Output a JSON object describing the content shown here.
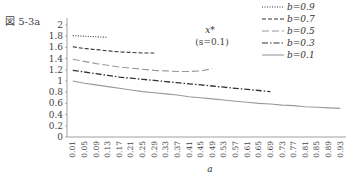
{
  "figure_label": "図 5-3a",
  "annotation": {
    "line1": "x*",
    "line2": "(s=0.1)"
  },
  "chart_data": {
    "type": "line",
    "title": "図 5-3a",
    "xlabel": "a",
    "ylabel": "",
    "ylim": [
      0,
      2.1
    ],
    "yticks": [
      "0",
      "0.2",
      "0.4",
      "0.6",
      "0.8",
      "1",
      "1.2",
      "1.4",
      "1.6",
      "1.8",
      "2"
    ],
    "x": [
      "0.01",
      "0.05",
      "0.09",
      "0.13",
      "0.17",
      "0.21",
      "0.25",
      "0.29",
      "0.33",
      "0.37",
      "0.41",
      "0.45",
      "0.49",
      "0.53",
      "0.57",
      "0.61",
      "0.65",
      "0.69",
      "0.73",
      "0.77",
      "0.81",
      "0.85",
      "0.89",
      "0.93"
    ],
    "legend_position": "top-right",
    "grid": false,
    "annotations": [
      "x*",
      "(s=0.1)"
    ],
    "series": [
      {
        "name": "b=0.9",
        "style": "dotted",
        "color": "#333333",
        "values": [
          1.81,
          1.8,
          1.79,
          1.78,
          null,
          null,
          null,
          null,
          null,
          null,
          null,
          null,
          null,
          null,
          null,
          null,
          null,
          null,
          null,
          null,
          null,
          null,
          null,
          null
        ]
      },
      {
        "name": "b=0.7",
        "style": "dashed",
        "color": "#333333",
        "values": [
          1.61,
          1.58,
          1.56,
          1.54,
          1.52,
          1.51,
          1.5,
          1.5,
          null,
          null,
          null,
          null,
          null,
          null,
          null,
          null,
          null,
          null,
          null,
          null,
          null,
          null,
          null,
          null
        ]
      },
      {
        "name": "b=0.5",
        "style": "long-dash",
        "color": "#999999",
        "values": [
          1.39,
          1.35,
          1.31,
          1.28,
          1.25,
          1.23,
          1.21,
          1.19,
          1.18,
          1.17,
          1.17,
          1.18,
          1.22,
          null,
          null,
          null,
          null,
          null,
          null,
          null,
          null,
          null,
          null,
          null
        ]
      },
      {
        "name": "b=0.3",
        "style": "dash-dot",
        "color": "#333333",
        "values": [
          1.19,
          1.16,
          1.13,
          1.1,
          1.07,
          1.05,
          1.03,
          1.01,
          0.99,
          0.97,
          0.95,
          0.93,
          0.91,
          0.89,
          0.87,
          0.85,
          0.83,
          0.81,
          null,
          null,
          null,
          null,
          null,
          null
        ]
      },
      {
        "name": "b=0.1",
        "style": "solid",
        "color": "#999999",
        "values": [
          1.0,
          0.96,
          0.93,
          0.9,
          0.87,
          0.84,
          0.81,
          0.79,
          0.77,
          0.75,
          0.72,
          0.7,
          0.68,
          0.66,
          0.64,
          0.62,
          0.6,
          0.59,
          0.57,
          0.56,
          0.54,
          0.53,
          0.52,
          0.51
        ]
      }
    ]
  },
  "legend": [
    {
      "label_var": "b",
      "label_val": "=0.9"
    },
    {
      "label_var": "b",
      "label_val": "=0.7"
    },
    {
      "label_var": "b",
      "label_val": "=0.5"
    },
    {
      "label_var": "b",
      "label_val": "=0.3"
    },
    {
      "label_var": "b",
      "label_val": "=0.1"
    }
  ]
}
